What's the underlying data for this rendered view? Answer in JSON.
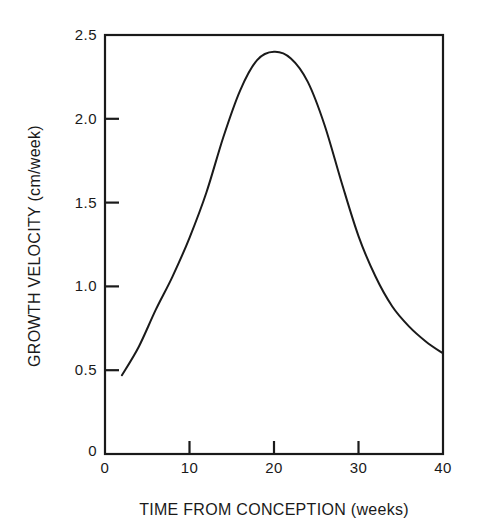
{
  "chart_data": {
    "type": "line",
    "title": "",
    "xlabel": "TIME FROM CONCEPTION (weeks)",
    "ylabel": "GROWTH VELOCITY (cm/week)",
    "xlim": [
      0,
      40
    ],
    "ylim": [
      0,
      2.5
    ],
    "x_ticks": [
      0,
      10,
      20,
      30,
      40
    ],
    "x_tick_labels": [
      "0",
      "10",
      "20",
      "30",
      "40"
    ],
    "y_ticks": [
      0,
      0.5,
      1.0,
      1.5,
      2.0,
      2.5
    ],
    "y_tick_labels": [
      "0",
      "0.5",
      "1.0",
      "1.5",
      "2.0",
      "2.5"
    ],
    "grid": false,
    "legend": null,
    "series": [
      {
        "name": "Growth velocity",
        "color": "#1a1a1a",
        "x": [
          2,
          4,
          6,
          8,
          10,
          12,
          14,
          16,
          18,
          20,
          22,
          24,
          26,
          28,
          30,
          32,
          34,
          36,
          38,
          40
        ],
        "values": [
          0.47,
          0.64,
          0.86,
          1.06,
          1.29,
          1.56,
          1.89,
          2.17,
          2.35,
          2.4,
          2.36,
          2.22,
          1.96,
          1.62,
          1.3,
          1.06,
          0.88,
          0.76,
          0.67,
          0.6
        ]
      }
    ]
  },
  "axes": {
    "x_title": "TIME FROM CONCEPTION (weeks)",
    "y_title": "GROWTH VELOCITY (cm/week)"
  },
  "colors": {
    "line": "#1a1a1a",
    "frame": "#1a1a1a",
    "background": "#ffffff"
  }
}
